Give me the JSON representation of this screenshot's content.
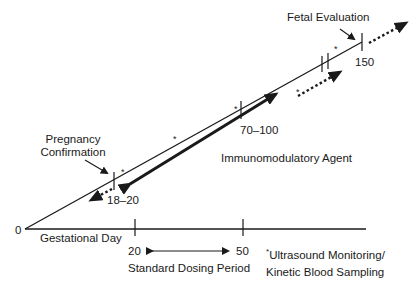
{
  "diagram": {
    "labels": {
      "fetal_evaluation": "Fetal Evaluation",
      "pregnancy_confirmation_line1": "Pregnancy",
      "pregnancy_confirmation_line2": "Confirmation",
      "immunomodulatory_agent": "Immunomodulatory Agent",
      "gestational_day": "Gestational Day",
      "standard_dosing_period": "Standard Dosing Period",
      "footnote_line1": "Ultrasound Monitoring/",
      "footnote_line2": "Kinetic Blood Sampling",
      "footnote_marker": "*"
    },
    "axis": {
      "origin": "0",
      "tick_20": "20",
      "tick_50": "50"
    },
    "diagonal_ticks": {
      "t1": "18–20",
      "t2": "70–100",
      "t3": "150"
    },
    "asterisks": [
      "*",
      "*",
      "*",
      "*",
      "*"
    ],
    "colors": {
      "line": "#1a1a1a",
      "background": "#ffffff"
    }
  }
}
